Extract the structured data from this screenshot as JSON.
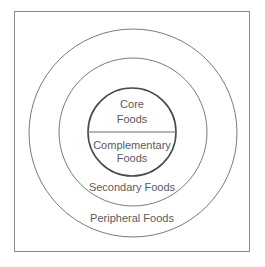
{
  "diagram": {
    "type": "concentric-circles",
    "layers": [
      {
        "id": "core",
        "label_lines": [
          "Core",
          "Foods"
        ]
      },
      {
        "id": "complementary",
        "label_lines": [
          "Complementary",
          "Foods"
        ]
      },
      {
        "id": "secondary",
        "label": "Secondary Foods"
      },
      {
        "id": "peripheral",
        "label": "Peripheral Foods"
      }
    ],
    "colors": {
      "stroke_outer": "#7a7a7a",
      "stroke_inner": "#4a4a4a",
      "text": "#5a5a5a",
      "background": "#ffffff"
    }
  }
}
